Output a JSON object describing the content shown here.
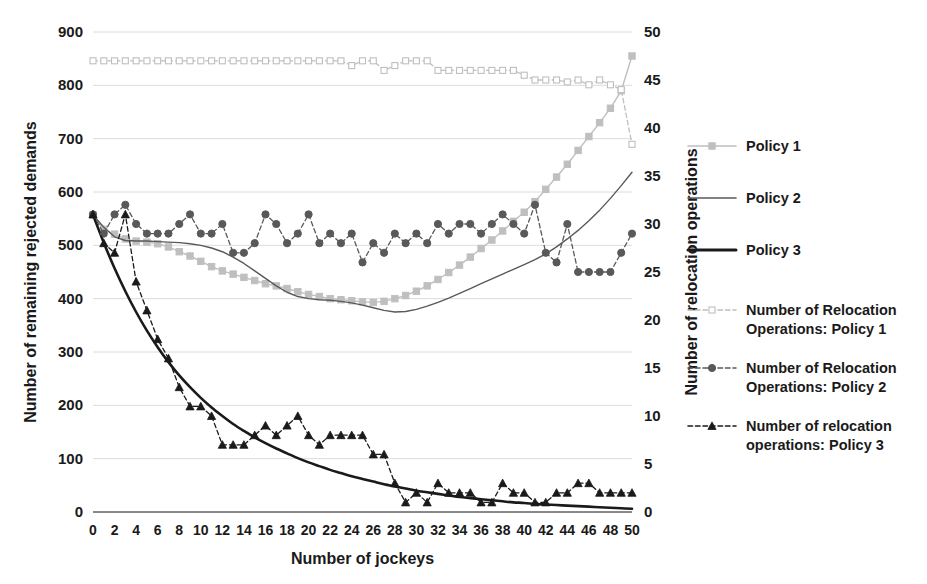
{
  "chart_data": {
    "type": "line",
    "title": "",
    "xlabel": "Number of jockeys",
    "ylabel": "Number of remaining rejected demands",
    "ylabel_secondary": "Number of relocation operations",
    "xlim": [
      0,
      50
    ],
    "ylim": [
      0,
      900
    ],
    "ylim_secondary": [
      0,
      50
    ],
    "xticks": [
      0,
      2,
      4,
      6,
      8,
      10,
      12,
      14,
      16,
      18,
      20,
      22,
      24,
      26,
      28,
      30,
      32,
      34,
      36,
      38,
      40,
      42,
      44,
      46,
      48,
      50
    ],
    "yticks": [
      0,
      100,
      200,
      300,
      400,
      500,
      600,
      700,
      800,
      900
    ],
    "yticks_secondary": [
      0,
      5,
      10,
      15,
      20,
      25,
      30,
      35,
      40,
      45,
      50
    ],
    "grid": true,
    "legend_position": "right",
    "x": [
      0,
      1,
      2,
      3,
      4,
      5,
      6,
      7,
      8,
      9,
      10,
      11,
      12,
      13,
      14,
      15,
      16,
      17,
      18,
      19,
      20,
      21,
      22,
      23,
      24,
      25,
      26,
      27,
      28,
      29,
      30,
      31,
      32,
      33,
      34,
      35,
      36,
      37,
      38,
      39,
      40,
      41,
      42,
      43,
      44,
      45,
      46,
      47,
      48,
      49,
      50
    ],
    "series": [
      {
        "name": "Policy 1",
        "axis": "left",
        "style": "solid",
        "marker": "square",
        "color": "#bfbfbf",
        "values": [
          557,
          530,
          521,
          512,
          508,
          506,
          503,
          497,
          488,
          480,
          470,
          460,
          452,
          446,
          440,
          434,
          428,
          424,
          419,
          413,
          408,
          404,
          400,
          398,
          396,
          394,
          393,
          395,
          400,
          406,
          414,
          424,
          436,
          449,
          463,
          478,
          494,
          510,
          527,
          545,
          562,
          582,
          605,
          628,
          652,
          678,
          704,
          730,
          757,
          790,
          855
        ]
      },
      {
        "name": "Policy 2",
        "axis": "left",
        "style": "solid",
        "marker": "cross",
        "color": "#595959",
        "values": [
          557,
          534,
          516,
          509,
          508,
          508,
          507,
          506,
          505,
          503,
          500,
          495,
          488,
          478,
          466,
          452,
          438,
          424,
          412,
          404,
          400,
          398,
          397,
          395,
          392,
          388,
          383,
          378,
          375,
          376,
          380,
          386,
          393,
          401,
          410,
          419,
          428,
          437,
          446,
          455,
          464,
          473,
          484,
          497,
          512,
          528,
          546,
          566,
          588,
          612,
          637
        ]
      },
      {
        "name": "Policy 3",
        "axis": "left",
        "style": "solid",
        "marker": "none",
        "color": "#1a1a1a",
        "values": [
          557,
          505,
          457,
          414,
          375,
          340,
          309,
          281,
          256,
          234,
          214,
          196,
          180,
          165,
          152,
          140,
          129,
          119,
          110,
          101,
          93,
          86,
          79,
          73,
          67,
          62,
          57,
          52,
          48,
          44,
          40,
          37,
          34,
          31,
          28,
          26,
          24,
          22,
          20,
          18,
          17,
          15,
          14,
          13,
          12,
          11,
          10,
          9,
          8,
          7,
          6
        ]
      },
      {
        "name": "Number of Relocation Operations: Policy 1",
        "axis": "right",
        "style": "dashed",
        "marker": "square-open",
        "color": "#bfbfbf",
        "values": [
          47,
          47,
          47,
          47,
          47,
          47,
          47,
          47,
          47,
          47,
          47,
          47,
          47,
          47,
          47,
          47,
          47,
          47,
          47,
          47,
          47,
          47,
          47,
          47,
          46.5,
          47,
          47,
          46,
          46.5,
          47,
          47,
          47,
          46,
          46,
          46,
          46,
          46,
          46,
          46,
          46,
          45.5,
          45,
          45,
          45,
          44.8,
          45,
          44.5,
          45,
          44.5,
          44,
          38.3
        ]
      },
      {
        "name": "Number of Relocation Operations: Policy 2",
        "axis": "right",
        "style": "dashed",
        "marker": "circle",
        "color": "#595959",
        "values": [
          31,
          29,
          31,
          32,
          30,
          29,
          29,
          29,
          30,
          31,
          29,
          29,
          30,
          27,
          27,
          28,
          31,
          30,
          28,
          29,
          31,
          28,
          29,
          28,
          29,
          26,
          28,
          27,
          29,
          28,
          29,
          28,
          30,
          29,
          30,
          30,
          29,
          30,
          31,
          30,
          29,
          32,
          27,
          26,
          30,
          25,
          25,
          25,
          25,
          27,
          29
        ]
      },
      {
        "name": "Number of relocation operations: Policy 3",
        "axis": "right",
        "style": "dashed",
        "marker": "triangle",
        "color": "#1a1a1a",
        "values": [
          31,
          28,
          27,
          31,
          24,
          21,
          18,
          16,
          13,
          11,
          11,
          10,
          7,
          7,
          7,
          8,
          9,
          8,
          9,
          10,
          8,
          7,
          8,
          8,
          8,
          8,
          6,
          6,
          3,
          1,
          2,
          1,
          3,
          2,
          2,
          2,
          1,
          1,
          3,
          2,
          2,
          1,
          1,
          2,
          2,
          3,
          3,
          2,
          2,
          2,
          2
        ]
      }
    ]
  },
  "legend": {
    "items": [
      {
        "label": "Policy 1"
      },
      {
        "label": "Policy 2"
      },
      {
        "label": "Policy 3"
      },
      {
        "label": "Number of Relocation",
        "label2": "Operations: Policy 1"
      },
      {
        "label": "Number of Relocation",
        "label2": "Operations: Policy 2"
      },
      {
        "label": "Number of relocation",
        "label2": "operations: Policy 3"
      }
    ]
  },
  "colors": {
    "policy1": "#bfbfbf",
    "policy2": "#595959",
    "policy3": "#1a1a1a",
    "grid": "#dcdcdc"
  }
}
